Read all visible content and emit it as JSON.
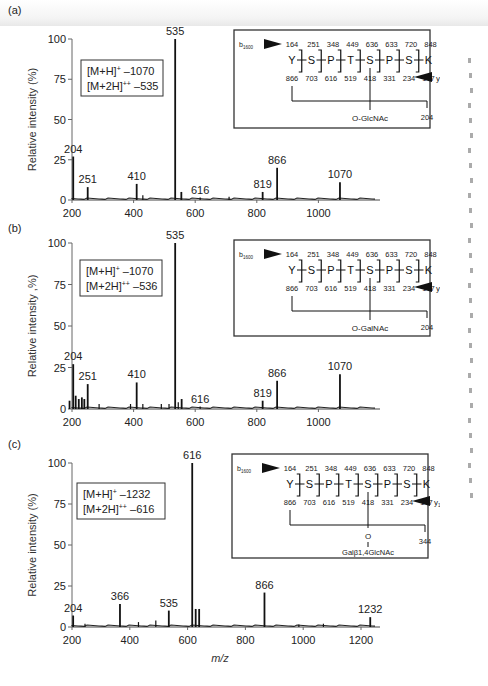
{
  "figure": {
    "xlabel": "m/z",
    "ylabel": "Relative intensity (%)",
    "ylabel_b": "Relative intensity ,%)"
  },
  "panels": [
    {
      "id": "a",
      "label": "(a)",
      "ion_box": {
        "line1_prefix": "[M+H]",
        "line1_sup": "+",
        "line1_value": " –1070",
        "line2_prefix": "[M+2H]",
        "line2_sup": "++",
        "line2_value": " –535"
      },
      "sequence": {
        "b_label": "b",
        "b_sub": "1600",
        "y_label": "y",
        "y_sub": "1600",
        "residues": [
          "Y",
          "S",
          "P",
          "T",
          "S",
          "P",
          "S",
          "K"
        ],
        "b_ions": [
          "164",
          "251",
          "348",
          "449",
          "636",
          "633",
          "720",
          "848"
        ],
        "y_ions": [
          "866",
          "703",
          "616",
          "519",
          "418",
          "331",
          "234",
          "147"
        ],
        "glycan": "O-GlcNAc",
        "glycan_extra": "",
        "oxonium": "204"
      }
    },
    {
      "id": "b",
      "label": "(b)",
      "ion_box": {
        "line1_prefix": "[M+H]",
        "line1_sup": "+",
        "line1_value": " –1070",
        "line2_prefix": "[M+2H]",
        "line2_sup": "++",
        "line2_value": " –536"
      },
      "sequence": {
        "b_label": "b",
        "b_sub": "1600",
        "y_label": "y",
        "y_sub": "1600",
        "residues": [
          "Y",
          "S",
          "P",
          "T",
          "S",
          "P",
          "S",
          "K"
        ],
        "b_ions": [
          "164",
          "251",
          "348",
          "449",
          "636",
          "633",
          "720",
          "848"
        ],
        "y_ions": [
          "866",
          "703",
          "616",
          "519",
          "418",
          "331",
          "234",
          "147"
        ],
        "glycan": "O-GalNAc",
        "glycan_extra": "",
        "oxonium": "204"
      }
    },
    {
      "id": "c",
      "label": "(c)",
      "ion_box": {
        "line1_prefix": "[M+H]",
        "line1_sup": "+",
        "line1_value": " –1232",
        "line2_prefix": "[M+2H]",
        "line2_sup": "++",
        "line2_value": " –616"
      },
      "sequence": {
        "b_label": "b",
        "b_sub": "1600",
        "y_label": "y",
        "y_sub": "1600",
        "residues": [
          "Y",
          "S",
          "P",
          "T",
          "S",
          "P",
          "S",
          "K"
        ],
        "b_ions": [
          "164",
          "251",
          "348",
          "449",
          "636",
          "633",
          "720",
          "848"
        ],
        "y_ions": [
          "866",
          "703",
          "616",
          "519",
          "418",
          "331",
          "234",
          "147"
        ],
        "glycan": "O",
        "glycan_extra": "Galβ1,4GlcNAc",
        "oxonium": "344"
      }
    }
  ],
  "chart_data": [
    {
      "type": "bar",
      "title": "(a)",
      "xlabel": "m/z",
      "ylabel": "Relative intensity (%)",
      "xlim": [
        200,
        1200
      ],
      "ylim": [
        0,
        100
      ],
      "xticks": [
        200,
        400,
        600,
        800,
        1000
      ],
      "yticks": [
        0,
        25,
        50,
        75,
        100
      ],
      "grid": false,
      "annotation": [
        "[M+H]+ –1070",
        "[M+2H]++ –535"
      ],
      "peaks": [
        {
          "mz": 204,
          "intensity": 27,
          "label": "204"
        },
        {
          "mz": 251,
          "intensity": 8,
          "label": "251"
        },
        {
          "mz": 410,
          "intensity": 10,
          "label": "410"
        },
        {
          "mz": 430,
          "intensity": 3,
          "label": ""
        },
        {
          "mz": 535,
          "intensity": 100,
          "label": "535"
        },
        {
          "mz": 555,
          "intensity": 5,
          "label": ""
        },
        {
          "mz": 616,
          "intensity": 1.5,
          "label": "616"
        },
        {
          "mz": 710,
          "intensity": 2,
          "label": ""
        },
        {
          "mz": 819,
          "intensity": 5,
          "label": "819"
        },
        {
          "mz": 866,
          "intensity": 20,
          "label": "866"
        },
        {
          "mz": 1070,
          "intensity": 11,
          "label": "1070"
        }
      ]
    },
    {
      "type": "bar",
      "title": "(b)",
      "xlabel": "m/z",
      "ylabel": "Relative intensity (%)",
      "xlim": [
        200,
        1200
      ],
      "ylim": [
        0,
        100
      ],
      "xticks": [
        200,
        400,
        600,
        800,
        1000
      ],
      "yticks": [
        0,
        25,
        50,
        75,
        100
      ],
      "grid": false,
      "annotation": [
        "[M+H]+ –1070",
        "[M+2H]++ –536"
      ],
      "peaks": [
        {
          "mz": 192,
          "intensity": 5,
          "label": ""
        },
        {
          "mz": 204,
          "intensity": 27,
          "label": "204"
        },
        {
          "mz": 212,
          "intensity": 8,
          "label": ""
        },
        {
          "mz": 222,
          "intensity": 6,
          "label": ""
        },
        {
          "mz": 232,
          "intensity": 7,
          "label": ""
        },
        {
          "mz": 240,
          "intensity": 6,
          "label": ""
        },
        {
          "mz": 251,
          "intensity": 15,
          "label": "251"
        },
        {
          "mz": 288,
          "intensity": 3,
          "label": ""
        },
        {
          "mz": 390,
          "intensity": 3,
          "label": ""
        },
        {
          "mz": 410,
          "intensity": 16,
          "label": "410"
        },
        {
          "mz": 430,
          "intensity": 3,
          "label": ""
        },
        {
          "mz": 490,
          "intensity": 3,
          "label": ""
        },
        {
          "mz": 515,
          "intensity": 3,
          "label": ""
        },
        {
          "mz": 535,
          "intensity": 100,
          "label": "535"
        },
        {
          "mz": 545,
          "intensity": 4,
          "label": ""
        },
        {
          "mz": 556,
          "intensity": 6,
          "label": ""
        },
        {
          "mz": 616,
          "intensity": 1.5,
          "label": "616"
        },
        {
          "mz": 819,
          "intensity": 5,
          "label": "819"
        },
        {
          "mz": 866,
          "intensity": 17,
          "label": "866"
        },
        {
          "mz": 1070,
          "intensity": 21,
          "label": "1070"
        }
      ]
    },
    {
      "type": "bar",
      "title": "(c)",
      "xlabel": "m/z",
      "ylabel": "Relative intensity (%)",
      "xlim": [
        200,
        1300
      ],
      "ylim": [
        0,
        100
      ],
      "xticks": [
        200,
        400,
        600,
        800,
        1000,
        1200
      ],
      "yticks": [
        0,
        25,
        50,
        75,
        100
      ],
      "grid": false,
      "annotation": [
        "[M+H]+ –1232",
        "[M+2H]++ –616"
      ],
      "peaks": [
        {
          "mz": 204,
          "intensity": 7,
          "label": "204"
        },
        {
          "mz": 245,
          "intensity": 2,
          "label": ""
        },
        {
          "mz": 366,
          "intensity": 14,
          "label": "366"
        },
        {
          "mz": 430,
          "intensity": 3,
          "label": ""
        },
        {
          "mz": 490,
          "intensity": 4,
          "label": ""
        },
        {
          "mz": 535,
          "intensity": 10,
          "label": "535"
        },
        {
          "mz": 616,
          "intensity": 100,
          "label": "616"
        },
        {
          "mz": 628,
          "intensity": 11,
          "label": ""
        },
        {
          "mz": 640,
          "intensity": 11,
          "label": ""
        },
        {
          "mz": 866,
          "intensity": 21,
          "label": "866"
        },
        {
          "mz": 985,
          "intensity": 1.5,
          "label": ""
        },
        {
          "mz": 1070,
          "intensity": 2,
          "label": ""
        },
        {
          "mz": 1232,
          "intensity": 6,
          "label": "1232"
        }
      ]
    }
  ]
}
